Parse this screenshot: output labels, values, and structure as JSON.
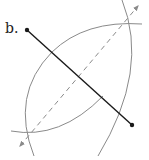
{
  "figure": {
    "label": "b.",
    "colors": {
      "segment": "#1a1a1a",
      "arcs": "#8a8a8a",
      "bisector": "#8a8a8a",
      "background": "#ffffff"
    },
    "segment": {
      "p1": [
        27,
        30
      ],
      "p2": [
        132,
        125
      ]
    },
    "arc_intersections": {
      "upper": [
        125,
        22
      ],
      "lower": [
        31,
        131
      ]
    },
    "bisector": {
      "start": [
        20,
        146
      ],
      "end": [
        138,
        6
      ],
      "style": "dashed",
      "arrows": "both"
    }
  }
}
